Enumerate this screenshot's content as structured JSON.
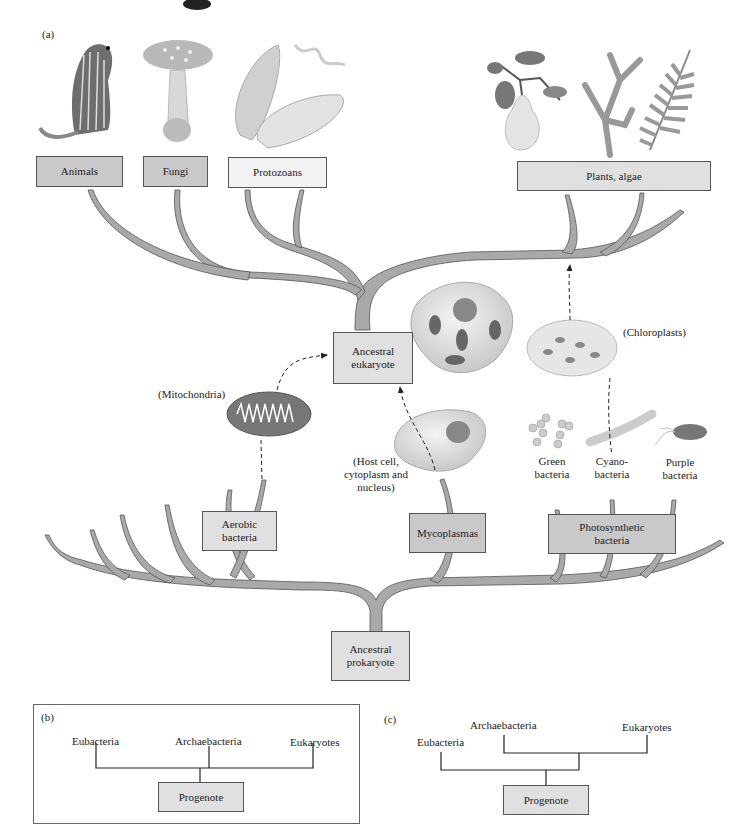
{
  "panel_a": {
    "tag": "(a)",
    "top_groups": {
      "animals": "Animals",
      "fungi": "Fungi",
      "protozoans": "Protozoans",
      "plants": "Plants, algae"
    },
    "ancestral_eukaryote": [
      "Ancestral",
      "eukaryote"
    ],
    "ancestral_prokaryote": [
      "Ancestral",
      "prokaryote"
    ],
    "aerobic_bacteria": [
      "Aerobic",
      "bacteria"
    ],
    "mycoplasmas": "Mycoplasmas",
    "photosynthetic_bacteria": [
      "Photosynthetic",
      "bacteria"
    ],
    "annotations": {
      "mitochondria": "(Mitochondria)",
      "chloroplasts": "(Chloroplasts)",
      "host_cell": [
        "(Host cell,",
        "cytoplasm and",
        "nucleus)"
      ],
      "green_bacteria": [
        "Green",
        "bacteria"
      ],
      "cyano_bacteria": [
        "Cyano-",
        "bacteria"
      ],
      "purple_bacteria": [
        "Purple",
        "bacteria"
      ]
    },
    "illustrations": [
      "ground-squirrel",
      "mushroom",
      "paramecium",
      "pear-branch",
      "seaweed",
      "fern",
      "eukaryotic-cell",
      "mitochondrion",
      "chloroplast",
      "host-cell",
      "green-bacteria-cluster",
      "cyanobacteria-filament",
      "purple-bacterium"
    ],
    "colors": {
      "branch": "#a9a9a9",
      "box_dark": "#c9c9c9",
      "box_light": "#e0e0e0"
    }
  },
  "panel_b": {
    "tag": "(b)",
    "leaves": [
      "Eubacteria",
      "Archaebacteria",
      "Eukaryotes"
    ],
    "root": "Progenote"
  },
  "panel_c": {
    "tag": "(c)",
    "leaves": [
      "Eubacteria",
      "Archaebacteria",
      "Eukaryotes"
    ],
    "root": "Progenote",
    "background": "#ececec"
  }
}
